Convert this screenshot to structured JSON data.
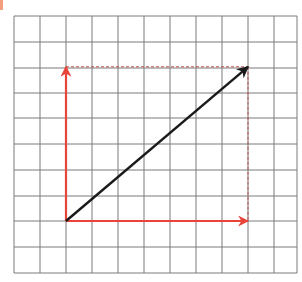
{
  "diagram": {
    "type": "vector-components-on-grid",
    "grid": {
      "columns": 11,
      "rows": 10,
      "x_lines": [
        14,
        40,
        66,
        92,
        118,
        144,
        170,
        196,
        222,
        248,
        274,
        297
      ],
      "y_lines": [
        16,
        42,
        68,
        93,
        118,
        144,
        170,
        196,
        221,
        247,
        273
      ],
      "line_color": "#7a7a7a"
    },
    "origin": {
      "col": 2,
      "row": 8
    },
    "vectors": [
      {
        "name": "horizontal-component",
        "from": [
          2,
          0
        ],
        "to": [
          9,
          0
        ],
        "dx": 7,
        "dy": 0,
        "color": "#e8443a"
      },
      {
        "name": "vertical-component",
        "from": [
          2,
          0
        ],
        "to": [
          2,
          6
        ],
        "dx": 0,
        "dy": 6,
        "color": "#e8443a"
      },
      {
        "name": "resultant",
        "from": [
          2,
          0
        ],
        "to": [
          9,
          6
        ],
        "dx": 7,
        "dy": 6,
        "color": "#1a1a1a"
      }
    ],
    "guides": [
      {
        "name": "horizontal-dashed-guide",
        "color": "#c0504d"
      },
      {
        "name": "vertical-dashed-guide",
        "color": "#c0504d"
      }
    ],
    "accent_mark_color": "#f4a080"
  }
}
